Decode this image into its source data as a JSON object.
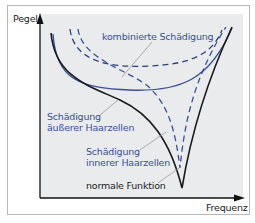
{
  "diagram": {
    "y_axis_label": "Pegel",
    "x_axis_label": "Frequenz",
    "labels": {
      "combined": "kombinierte Schädigung",
      "outer_line1": "Schädigung",
      "outer_line2": "äußerer Haarzellen",
      "inner_line1": "Schädigung",
      "inner_line2": "innerer Haarzellen",
      "normal": "normale Funktion"
    },
    "curves": [
      {
        "name": "normale Funktion",
        "style": "solid",
        "color": "#1a1a1a"
      },
      {
        "name": "Schädigung äußerer Haarzellen",
        "style": "solid",
        "color": "#3a4f9a"
      },
      {
        "name": "Schädigung innerer Haarzellen",
        "style": "dashed",
        "color": "#3a4f9a"
      },
      {
        "name": "kombinierte Schädigung",
        "style": "dashed",
        "color": "#2e3f7a"
      }
    ],
    "colors": {
      "plot_bg": "#e9ebed",
      "frame_border": "#b8b8b8",
      "label_blue": "#3a4f9a",
      "black": "#1a1a1a"
    }
  }
}
